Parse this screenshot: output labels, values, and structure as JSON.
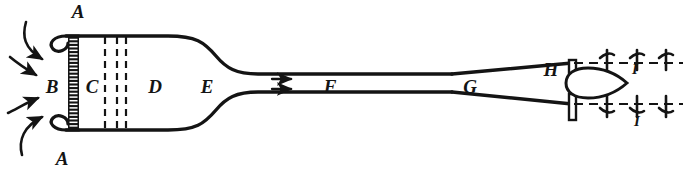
{
  "figure": {
    "ink_color": "#141414",
    "background_color": "#ffffff",
    "labels": [
      {
        "id": "A-top",
        "text": "A",
        "x": 78,
        "y": 18,
        "size": "large",
        "meaning": "inlet-bell-lip-upper"
      },
      {
        "id": "A-bottom",
        "text": "A",
        "x": 62,
        "y": 165,
        "size": "large",
        "meaning": "inlet-bell-lip-lower"
      },
      {
        "id": "B",
        "text": "B",
        "x": 52,
        "y": 93,
        "size": "large",
        "meaning": "honeycomb-straightener"
      },
      {
        "id": "C",
        "text": "C",
        "x": 92,
        "y": 93,
        "size": "large",
        "meaning": "screen-section"
      },
      {
        "id": "D",
        "text": "D",
        "x": 155,
        "y": 93,
        "size": "large",
        "meaning": "settling-chamber"
      },
      {
        "id": "E",
        "text": "E",
        "x": 207,
        "y": 93,
        "size": "large",
        "meaning": "contraction-entry"
      },
      {
        "id": "F",
        "text": "F",
        "x": 330,
        "y": 93,
        "size": "large",
        "meaning": "working-section"
      },
      {
        "id": "G",
        "text": "G",
        "x": 470,
        "y": 93,
        "size": "large",
        "meaning": "diffuser"
      },
      {
        "id": "H",
        "text": "H",
        "x": 551,
        "y": 76,
        "size": "large",
        "meaning": "fan-hub"
      },
      {
        "id": "I-top",
        "text": "I",
        "x": 635,
        "y": 74,
        "size": "small",
        "meaning": "fan-blade-upper"
      },
      {
        "id": "I-bottom",
        "text": "I",
        "x": 637,
        "y": 126,
        "size": "small",
        "meaning": "fan-blade-lower"
      }
    ],
    "flow_arrows": {
      "inlet": {
        "count": 4,
        "description": "curved intake airflow arrows at left of bell mouth"
      },
      "working_section": {
        "count": 2,
        "description": "straight horizontal flow arrows in working section before F"
      }
    },
    "components": {
      "honeycomb": {
        "label_ref": "B",
        "rungs": 26,
        "description": "ladder-hatched vertical honeycomb block"
      },
      "screens": {
        "label_ref": "C",
        "dashed_lines": 3,
        "description": "three dashed vertical gauze screens"
      },
      "fan": {
        "label_ref": "H",
        "description": "teardrop fan hub with vertical shaft"
      },
      "blades": {
        "label_ref": "I",
        "upper_marks": 3,
        "lower_marks": 3,
        "description": "blade tick marks on dash-dot centre lines"
      }
    }
  }
}
